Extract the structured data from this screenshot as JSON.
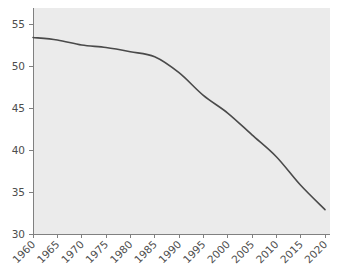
{
  "chart_data": {
    "type": "line",
    "title": "",
    "subtitle": "",
    "xlabel": "",
    "ylabel": "",
    "xlim": [
      1960,
      2020
    ],
    "ylim": [
      30,
      55
    ],
    "grid": false,
    "legend": false,
    "legend_position": "none",
    "line_color": "#4a4a4a",
    "plot_background": "#ebebeb",
    "figure_background": "#ffffff",
    "axis_color": "#808080",
    "tick_label_color": "#4d4d4d",
    "x": [
      1960,
      1965,
      1970,
      1975,
      1980,
      1985,
      1990,
      1995,
      2000,
      2005,
      2010,
      2015,
      2020
    ],
    "xtick_labels": [
      "1960",
      "1965",
      "1970",
      "1975",
      "1980",
      "1985",
      "1990",
      "1995",
      "2000",
      "2005",
      "2010",
      "2015",
      "2020"
    ],
    "xtick_rotation": 45,
    "ytick_values": [
      30,
      35,
      40,
      45,
      50,
      55
    ],
    "ytick_labels": [
      "30",
      "35",
      "40",
      "45",
      "50",
      "55"
    ],
    "series": [
      {
        "name": "",
        "values": [
          53.4,
          53.1,
          52.5,
          52.2,
          51.7,
          51.1,
          49.2,
          46.5,
          44.4,
          41.8,
          39.2,
          35.8,
          32.9
        ]
      }
    ]
  }
}
